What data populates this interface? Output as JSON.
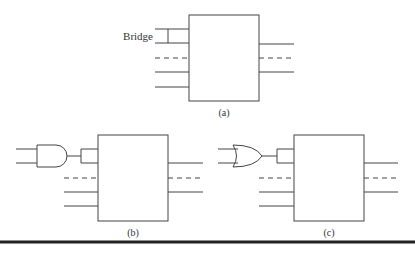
{
  "labels": {
    "bridge": "Bridge",
    "a": "(a)",
    "b": "(b)",
    "c": "(c)"
  },
  "colors": {
    "line": "#444444",
    "rule": "#222222"
  }
}
